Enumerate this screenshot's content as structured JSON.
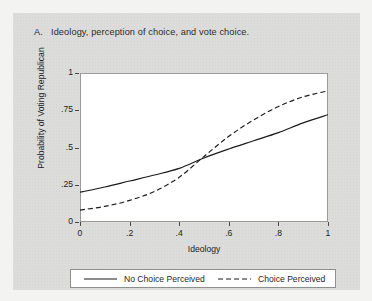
{
  "figure": {
    "panel_letter": "A.",
    "panel_title": "Ideology, perception of choice, and vote choice."
  },
  "chart_data": {
    "type": "line",
    "xlabel": "Ideology",
    "ylabel": "Probability of Voting Republican",
    "xlim": [
      0,
      1
    ],
    "ylim": [
      0,
      1
    ],
    "xticks": [
      "0",
      ".2",
      ".4",
      ".6",
      ".8",
      "1"
    ],
    "xtick_values": [
      0,
      0.2,
      0.4,
      0.6,
      0.8,
      1
    ],
    "yticks": [
      "0",
      ".25",
      ".5",
      ".75",
      "1"
    ],
    "ytick_values": [
      0,
      0.25,
      0.5,
      0.75,
      1
    ],
    "grid": false,
    "legend_position": "bottom",
    "x": [
      0,
      0.1,
      0.2,
      0.3,
      0.4,
      0.5,
      0.6,
      0.7,
      0.8,
      0.9,
      1
    ],
    "series": [
      {
        "name": "No Choice Perceived",
        "style": "solid",
        "color": "#1a1a1a",
        "values": [
          0.2,
          0.235,
          0.275,
          0.315,
          0.36,
          0.43,
          0.49,
          0.545,
          0.6,
          0.665,
          0.72
        ]
      },
      {
        "name": "Choice Perceived",
        "style": "dashed",
        "color": "#1a1a1a",
        "values": [
          0.08,
          0.105,
          0.145,
          0.205,
          0.3,
          0.44,
          0.575,
          0.685,
          0.775,
          0.84,
          0.88
        ]
      }
    ]
  },
  "legend": {
    "entries": [
      {
        "label": "No Choice Perceived",
        "style": "solid"
      },
      {
        "label": "Choice Perceived",
        "style": "dashed"
      }
    ]
  }
}
